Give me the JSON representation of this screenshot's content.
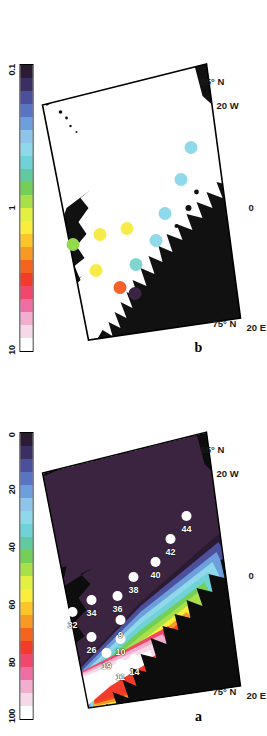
{
  "figure": {
    "type": "two-panel-map",
    "region": "Nordic Seas / Greenland Sea",
    "panels": [
      {
        "id": "a",
        "letter": "a"
      },
      {
        "id": "b",
        "letter": "b"
      }
    ]
  },
  "panel_a": {
    "letter": "a",
    "axis_labels": {
      "lat_75": "75° N",
      "lat_65": "65° N",
      "lon_20w": "20 W",
      "lon_0": "0",
      "lon_20e": "20 E"
    },
    "colorbar": {
      "ticks": [
        "100",
        "80",
        "60",
        "40",
        "20",
        "0"
      ],
      "min": 0,
      "max": 100,
      "colors": [
        "#ffffff",
        "#f5d9e8",
        "#f3aecf",
        "#ef6fa5",
        "#f2476d",
        "#f23b2a",
        "#f4641f",
        "#f79a23",
        "#fbc52b",
        "#fbee3a",
        "#e2f041",
        "#a9e04a",
        "#73cf55",
        "#62c9a0",
        "#6fd2d6",
        "#8fd8ea",
        "#8ec3ea",
        "#6e9fdd",
        "#5a74c4",
        "#4b4f9c",
        "#3a2f63",
        "#2b1b32"
      ]
    },
    "stations": [
      {
        "label": "11",
        "x": 0.205,
        "y": 0.4
      },
      {
        "label": "14",
        "x": 0.223,
        "y": 0.468
      },
      {
        "label": "19",
        "x": 0.243,
        "y": 0.333
      },
      {
        "label": "10",
        "x": 0.29,
        "y": 0.398
      },
      {
        "label": "9",
        "x": 0.352,
        "y": 0.4
      },
      {
        "label": "26",
        "x": 0.295,
        "y": 0.262
      },
      {
        "label": "32",
        "x": 0.38,
        "y": 0.172
      },
      {
        "label": "34",
        "x": 0.42,
        "y": 0.262
      },
      {
        "label": "36",
        "x": 0.432,
        "y": 0.388
      },
      {
        "label": "38",
        "x": 0.498,
        "y": 0.462
      },
      {
        "label": "40",
        "x": 0.545,
        "y": 0.565
      },
      {
        "label": "42",
        "x": 0.622,
        "y": 0.64
      },
      {
        "label": "44",
        "x": 0.7,
        "y": 0.712
      }
    ]
  },
  "panel_b": {
    "letter": "b",
    "axis_labels": {
      "lat_75": "75° N",
      "lat_65": "65° N",
      "lon_20w": "20 W",
      "lon_0": "0",
      "lon_20e": "20 E"
    },
    "colorbar": {
      "ticks": [
        "10",
        "1",
        "0.1"
      ],
      "min": 0.1,
      "max": 10,
      "scale": "log",
      "colors": [
        "#ffffff",
        "#f5d9e8",
        "#f3aecf",
        "#ef6fa5",
        "#f2476d",
        "#f23b2a",
        "#f4641f",
        "#f79a23",
        "#fbc52b",
        "#fbee3a",
        "#e2f041",
        "#a9e04a",
        "#73cf55",
        "#62c9a0",
        "#6fd2d6",
        "#8fd8ea",
        "#8ec3ea",
        "#6e9fdd",
        "#5a74c4",
        "#4b4f9c",
        "#3a2f63",
        "#2b1b32"
      ]
    },
    "stations": [
      {
        "label": "",
        "x": 0.215,
        "y": 0.47,
        "color": "#3b2344"
      },
      {
        "label": "",
        "x": 0.236,
        "y": 0.398,
        "color": "#f8602a"
      },
      {
        "label": "",
        "x": 0.29,
        "y": 0.285,
        "color": "#f7eb48"
      },
      {
        "label": "",
        "x": 0.312,
        "y": 0.475,
        "color": "#7fd4cf"
      },
      {
        "label": "",
        "x": 0.378,
        "y": 0.173,
        "color": "#92d94e"
      },
      {
        "label": "",
        "x": 0.392,
        "y": 0.567,
        "color": "#8fd9ea"
      },
      {
        "label": "",
        "x": 0.41,
        "y": 0.3,
        "color": "#f7eb48"
      },
      {
        "label": "",
        "x": 0.432,
        "y": 0.43,
        "color": "#f7eb48"
      },
      {
        "label": "",
        "x": 0.48,
        "y": 0.61,
        "color": "#8fd9ea"
      },
      {
        "label": "",
        "x": 0.595,
        "y": 0.688,
        "color": "#8fd9ea"
      },
      {
        "label": "",
        "x": 0.7,
        "y": 0.735,
        "color": "#8fd9ea"
      }
    ]
  },
  "chart_data": {
    "type": "map",
    "title": "",
    "panels": [
      {
        "id": "a",
        "label": "a",
        "quantity": "percent",
        "colorbar_range": [
          0,
          100
        ],
        "colorbar_ticks": [
          100,
          80,
          60,
          40,
          20,
          0
        ],
        "lat_range": [
          "65 N",
          "80 N"
        ],
        "lon_range": [
          "20 W",
          "20 E"
        ],
        "station_labels": [
          11,
          14,
          19,
          10,
          9,
          26,
          32,
          34,
          36,
          38,
          40,
          42,
          44
        ],
        "marker_style": "white filled circle",
        "background": "bathymetry / filled colour field"
      },
      {
        "id": "b",
        "label": "b",
        "quantity": "log-scaled value",
        "colorbar_range": [
          0.1,
          10
        ],
        "colorbar_ticks": [
          10,
          1,
          0.1
        ],
        "colorbar_scale": "log",
        "lat_range": [
          "65 N",
          "80 N"
        ],
        "lon_range": [
          "20 W",
          "20 E"
        ],
        "marker_style": "coloured filled circle",
        "station_values_by_colour": [
          "dark-purple (~0.1)",
          "orange-red (~5)",
          "yellow (~2)",
          "teal (~0.6)",
          "green (~1.3)",
          "light-blue (~0.4)",
          "yellow (~2)",
          "yellow (~2)",
          "light-blue (~0.4)",
          "light-blue (~0.4)",
          "light-blue (~0.35)"
        ],
        "background": "white ocean with black land mask"
      }
    ]
  }
}
